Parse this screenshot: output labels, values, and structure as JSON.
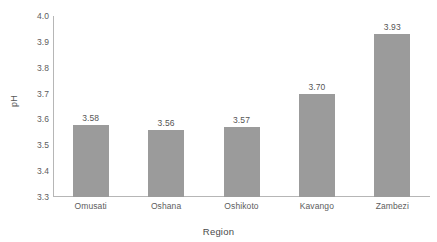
{
  "chart_data": {
    "type": "bar",
    "title": "",
    "xlabel": "Region",
    "ylabel": "pH",
    "categories": [
      "Omusati",
      "Oshana",
      "Oshikoto",
      "Kavango",
      "Zambezi"
    ],
    "values": [
      3.58,
      3.56,
      3.57,
      3.7,
      3.93
    ],
    "value_labels": [
      "3.58",
      "3.56",
      "3.57",
      "3.70",
      "3.93"
    ],
    "ylim": [
      3.3,
      4.0
    ],
    "ytick_labels": [
      "4.0",
      "3.9",
      "3.8",
      "3.7",
      "3.6",
      "3.5",
      "3.4",
      "3.3"
    ],
    "ytick_values": [
      4.0,
      3.9,
      3.8,
      3.7,
      3.6,
      3.5,
      3.4,
      3.3
    ],
    "grid": false,
    "legend": false,
    "bar_color": "#9b9b9b",
    "axis_color": "#b6b6b6",
    "text_color": "#5d5d5d",
    "background": "#ffffff"
  }
}
